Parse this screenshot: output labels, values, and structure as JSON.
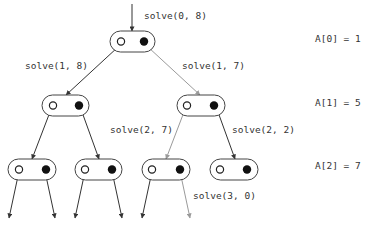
{
  "colors": {
    "dark": "#333333",
    "gray": "#9a9a9a",
    "text": "#333333",
    "background": "#ffffff"
  },
  "root_call": {
    "label": "solve(0, 8)",
    "x": 144,
    "y": 19
  },
  "nodes": [
    {
      "id": "n0",
      "x": 110,
      "y": 31,
      "w": 45,
      "h": 21,
      "open_cx": 121,
      "filled_cx": 144
    },
    {
      "id": "n1L",
      "x": 42,
      "y": 95,
      "w": 47,
      "h": 21,
      "open_cx": 53,
      "filled_cx": 79
    },
    {
      "id": "n1R",
      "x": 177,
      "y": 95,
      "w": 48,
      "h": 21,
      "open_cx": 187,
      "filled_cx": 214
    },
    {
      "id": "n2A",
      "x": 8,
      "y": 159,
      "w": 48,
      "h": 21,
      "open_cx": 19,
      "filled_cx": 46
    },
    {
      "id": "n2B",
      "x": 75,
      "y": 159,
      "w": 47,
      "h": 21,
      "open_cx": 85,
      "filled_cx": 112
    },
    {
      "id": "n2C",
      "x": 142,
      "y": 159,
      "w": 48,
      "h": 21,
      "open_cx": 152,
      "filled_cx": 180
    },
    {
      "id": "n2D",
      "x": 210,
      "y": 159,
      "w": 48,
      "h": 21,
      "open_cx": 220,
      "filled_cx": 247
    }
  ],
  "edges": [
    {
      "x1": 132,
      "y1": 4,
      "x2": 132,
      "y2": 31,
      "color": "dark",
      "label": ""
    },
    {
      "x1": 118,
      "y1": 47,
      "x2": 66,
      "y2": 95,
      "color": "dark",
      "label": "solve(1, 8)"
    },
    {
      "x1": 148,
      "y1": 47,
      "x2": 200,
      "y2": 95,
      "color": "gray",
      "label": "solve(1, 7)"
    },
    {
      "x1": 50,
      "y1": 112,
      "x2": 32,
      "y2": 159,
      "color": "dark",
      "label": ""
    },
    {
      "x1": 82,
      "y1": 112,
      "x2": 99,
      "y2": 159,
      "color": "dark",
      "label": ""
    },
    {
      "x1": 184,
      "y1": 112,
      "x2": 166,
      "y2": 159,
      "color": "gray",
      "label": "solve(2, 7)"
    },
    {
      "x1": 218,
      "y1": 112,
      "x2": 235,
      "y2": 159,
      "color": "dark",
      "label": "solve(2, 2)"
    },
    {
      "x1": 18,
      "y1": 176,
      "x2": 9,
      "y2": 218,
      "color": "dark",
      "label": ""
    },
    {
      "x1": 46,
      "y1": 176,
      "x2": 55,
      "y2": 218,
      "color": "dark",
      "label": ""
    },
    {
      "x1": 84,
      "y1": 176,
      "x2": 75,
      "y2": 218,
      "color": "dark",
      "label": ""
    },
    {
      "x1": 113,
      "y1": 176,
      "x2": 122,
      "y2": 218,
      "color": "dark",
      "label": ""
    },
    {
      "x1": 151,
      "y1": 176,
      "x2": 142,
      "y2": 218,
      "color": "dark",
      "label": ""
    },
    {
      "x1": 181,
      "y1": 176,
      "x2": 190,
      "y2": 218,
      "color": "gray",
      "label": "solve(3, 0)"
    }
  ],
  "edge_labels": [
    {
      "text": "solve(1, 8)",
      "x": 25,
      "y": 69
    },
    {
      "text": "solve(1, 7)",
      "x": 182,
      "y": 69
    },
    {
      "text": "solve(2, 7)",
      "x": 110,
      "y": 133
    },
    {
      "text": "solve(2, 2)",
      "x": 232,
      "y": 133
    },
    {
      "text": "solve(3, 0)",
      "x": 193,
      "y": 199
    }
  ],
  "array_values": [
    {
      "text": "A[0] = 1",
      "x": 315,
      "y": 42
    },
    {
      "text": "A[1] = 5",
      "x": 315,
      "y": 106
    },
    {
      "text": "A[2] = 7",
      "x": 315,
      "y": 169
    }
  ]
}
